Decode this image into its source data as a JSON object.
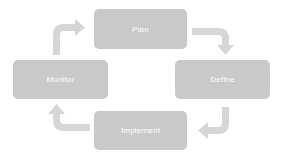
{
  "diagram": {
    "type": "cycle",
    "nodes": [
      {
        "id": "plan",
        "label": "Plan"
      },
      {
        "id": "define",
        "label": "Define"
      },
      {
        "id": "implement",
        "label": "Implement"
      },
      {
        "id": "monitor",
        "label": "Monitor"
      }
    ],
    "edges": [
      {
        "from": "plan",
        "to": "define"
      },
      {
        "from": "define",
        "to": "implement"
      },
      {
        "from": "implement",
        "to": "monitor"
      },
      {
        "from": "monitor",
        "to": "plan"
      }
    ],
    "colors": {
      "box_fill": "#c9c9c9",
      "arrow_fill": "#d6d6d6",
      "text": "#ffffff"
    }
  }
}
